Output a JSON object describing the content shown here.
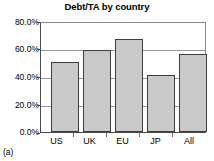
{
  "caption": "(a)",
  "chart_data": {
    "type": "bar",
    "title": "Debt/TA by country",
    "xlabel": "",
    "ylabel": "",
    "categories": [
      "US",
      "UK",
      "EU",
      "JP",
      "All"
    ],
    "values": [
      51.5,
      60.0,
      68.5,
      41.5,
      57.5
    ],
    "ylim": [
      0,
      80
    ],
    "ytick_values": [
      0,
      20,
      40,
      60,
      80
    ],
    "ytick_labels": [
      "0.0%",
      "20.0%",
      "40.0%",
      "60.0%",
      "80.0%"
    ],
    "grid": true,
    "legend": false,
    "series": [
      {
        "name": "Debt/TA",
        "values": [
          51.5,
          60.0,
          68.5,
          41.5,
          57.5
        ]
      }
    ],
    "colors": {
      "bar_fill": "#c9c9c9",
      "bar_edge": "#3d3d3d",
      "gridline": "#9a9a9a",
      "axis": "#4a4a4a",
      "background": "#ffffff",
      "text": "#000000"
    }
  }
}
